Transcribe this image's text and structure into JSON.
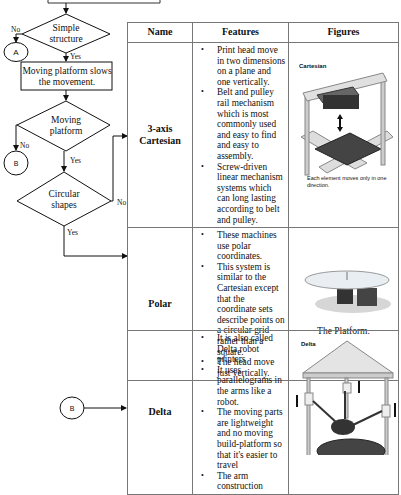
{
  "flowchart": {
    "decision_simple": "Simple structure",
    "connector_a": "A",
    "process_moving": "Moving platform slows the movement.",
    "decision_moving_platform": "Moving platform",
    "connector_b": "B",
    "decision_circular": "Circular shapes",
    "labels": {
      "no1": "No",
      "yes1": "Yes",
      "no2": "No",
      "yes2": "Yes",
      "no3": "No",
      "yes3": "Yes"
    },
    "connector_b_lower": "B"
  },
  "table": {
    "headers": [
      "Name",
      "Features",
      "Figures"
    ],
    "rows": [
      {
        "name": "3-axis Cartesian",
        "features": [
          "Print head move in two dimensions on a plane and one vertically.",
          "Belt and pulley rail mechanism which is most commonly used and easy to find and easy to assembly.",
          "Screw-driven linear mechanism systems which can long lasting according to belt and pulley."
        ],
        "figure_title": "Cartesian",
        "figure_caption": "Each element moves only in one direction."
      },
      {
        "name": "Polar",
        "features": [
          "These machines use polar coordinates.",
          "This system is similar to the Cartesian except that the coordinate sets describe points on a circular grid rather than a square.",
          "The head move just vertically."
        ],
        "figure_caption": "The Platform."
      }
    ]
  },
  "delta_table": {
    "name": "Delta",
    "features": [
      "It is also called Delta robot printers",
      "It uses parallelograms in the arms like a robot.",
      "The moving parts are lightweight and  no moving build-platform so that it's easier to travel",
      "The arm construction"
    ],
    "figure_title": "Delta"
  }
}
